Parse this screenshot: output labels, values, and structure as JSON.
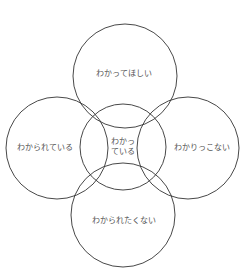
{
  "diagram": {
    "stroke_color": "#333333",
    "text_color": "#555555",
    "circles": [
      {
        "id": "top",
        "label": "わかってほしい",
        "cx": 125,
        "cy": 76,
        "r": 52
      },
      {
        "id": "left",
        "label": "わかられている",
        "cx": 57,
        "cy": 148,
        "r": 51
      },
      {
        "id": "right",
        "label": "わかりっこない",
        "cx": 188,
        "cy": 148,
        "r": 51
      },
      {
        "id": "bottom",
        "label": "わかられたくない",
        "cx": 123,
        "cy": 215,
        "r": 52
      },
      {
        "id": "center",
        "label_line1": "わかっ",
        "label_line2": "ている",
        "cx": 123,
        "cy": 147,
        "r": 43
      }
    ]
  }
}
